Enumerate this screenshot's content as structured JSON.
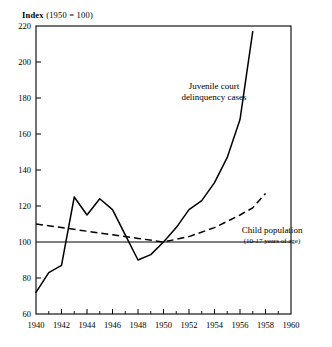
{
  "chart_data": {
    "type": "line",
    "title": "",
    "ylabel": "Index (1950 = 100)",
    "xlabel": "",
    "ylim": [
      60,
      220
    ],
    "xlim": [
      1940,
      1960
    ],
    "grid": false,
    "legend": "annotations-on-plot",
    "yticks": [
      60,
      80,
      100,
      120,
      140,
      160,
      180,
      200,
      220
    ],
    "xticks": [
      1940,
      1942,
      1944,
      1946,
      1948,
      1950,
      1952,
      1954,
      1956,
      1958,
      1960
    ],
    "xticks_minor": [
      1941,
      1943,
      1945,
      1947,
      1949,
      1951,
      1953,
      1955,
      1957,
      1959
    ],
    "reference_line": {
      "value": 100,
      "style": "solid"
    },
    "annotations": [
      {
        "id": "juvenile",
        "line1": "Juvenile court",
        "line2": "delinquency cases"
      },
      {
        "id": "child",
        "line1": "Child population",
        "line2": "(10-17 years of age)"
      }
    ],
    "series": [
      {
        "name": "Juvenile court delinquency cases",
        "style": "solid",
        "x": [
          1940,
          1941,
          1942,
          1943,
          1944,
          1945,
          1946,
          1947,
          1948,
          1949,
          1950,
          1951,
          1952,
          1953,
          1954,
          1955,
          1956,
          1957
        ],
        "values": [
          72,
          83,
          87,
          125,
          115,
          124,
          118,
          104,
          90,
          93,
          100,
          108,
          118,
          123,
          133,
          147,
          168,
          217
        ]
      },
      {
        "name": "Child population (10-17 years of age)",
        "style": "dashed",
        "x": [
          1940,
          1942,
          1944,
          1946,
          1948,
          1950,
          1952,
          1954,
          1956,
          1957,
          1958
        ],
        "values": [
          110,
          108,
          106,
          104,
          102,
          100,
          103,
          108,
          115,
          119,
          127
        ]
      }
    ]
  },
  "labels": {
    "y": [
      "220",
      "200",
      "180",
      "160",
      "140",
      "120",
      "100",
      "80",
      "60"
    ],
    "x": [
      "1940",
      "1942",
      "1944",
      "1946",
      "1948",
      "1950",
      "1952",
      "1954",
      "1956",
      "1958",
      "1960"
    ],
    "axis_title_prefix": "Index",
    "axis_title_rest": "(1950 = 100)",
    "anno_juvenile_1": "Juvenile court",
    "anno_juvenile_2": "delinquency cases",
    "anno_child_1": "Child population",
    "anno_child_2": "(10-17 years of age)"
  }
}
